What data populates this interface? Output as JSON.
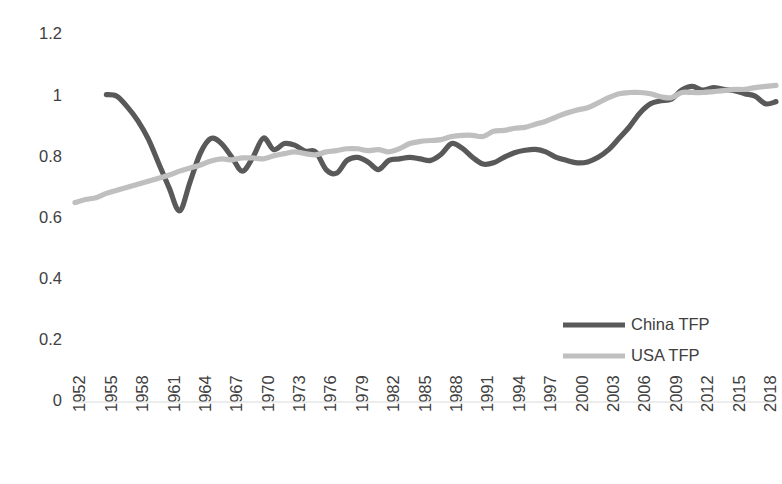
{
  "chart_data": {
    "type": "line",
    "title": "",
    "subtitle": "",
    "xlabel": "",
    "ylabel": "",
    "xlim": [
      1952,
      2019
    ],
    "ylim": [
      0,
      1.2
    ],
    "grid": false,
    "legend_position": "inside-right",
    "y_ticks": [
      "0",
      "0.2",
      "0.4",
      "0.6",
      "0.8",
      "1",
      "1.2"
    ],
    "y_tick_values": [
      0,
      0.2,
      0.4,
      0.6,
      0.8,
      1,
      1.2
    ],
    "x_ticks": [
      "1952",
      "1955",
      "1958",
      "1961",
      "1964",
      "1967",
      "1970",
      "1973",
      "1976",
      "1979",
      "1982",
      "1985",
      "1988",
      "1991",
      "1994",
      "1997",
      "2000",
      "2003",
      "2006",
      "2009",
      "2012",
      "2015",
      "2018"
    ],
    "x_tick_values": [
      1952,
      1955,
      1958,
      1961,
      1964,
      1967,
      1970,
      1973,
      1976,
      1979,
      1982,
      1985,
      1988,
      1991,
      1994,
      1997,
      2000,
      2003,
      2006,
      2009,
      2012,
      2015,
      2018
    ],
    "x_all_years": [
      1952,
      1953,
      1954,
      1955,
      1956,
      1957,
      1958,
      1959,
      1960,
      1961,
      1962,
      1963,
      1964,
      1965,
      1966,
      1967,
      1968,
      1969,
      1970,
      1971,
      1972,
      1973,
      1974,
      1975,
      1976,
      1977,
      1978,
      1979,
      1980,
      1981,
      1982,
      1983,
      1984,
      1985,
      1986,
      1987,
      1988,
      1989,
      1990,
      1991,
      1992,
      1993,
      1994,
      1995,
      1996,
      1997,
      1998,
      1999,
      2000,
      2001,
      2002,
      2003,
      2004,
      2005,
      2006,
      2007,
      2008,
      2009,
      2010,
      2011,
      2012,
      2013,
      2014,
      2015,
      2016,
      2017,
      2018,
      2019
    ],
    "series": [
      {
        "name": "China TFP",
        "color": "#595959",
        "stroke_width": 5.2,
        "start_year": 1955,
        "x": [
          1955,
          1956,
          1957,
          1958,
          1959,
          1960,
          1961,
          1962,
          1963,
          1964,
          1965,
          1966,
          1967,
          1968,
          1969,
          1970,
          1971,
          1972,
          1973,
          1974,
          1975,
          1976,
          1977,
          1978,
          1979,
          1980,
          1981,
          1982,
          1983,
          1984,
          1985,
          1986,
          1987,
          1988,
          1989,
          1990,
          1991,
          1992,
          1993,
          1994,
          1995,
          1996,
          1997,
          1998,
          1999,
          2000,
          2001,
          2002,
          2003,
          2004,
          2005,
          2006,
          2007,
          2008,
          2009,
          2010,
          2011,
          2012,
          2013,
          2014,
          2015,
          2016,
          2017,
          2018,
          2019
        ],
        "values": [
          1.005,
          1.0,
          0.965,
          0.92,
          0.86,
          0.78,
          0.7,
          0.625,
          0.72,
          0.815,
          0.862,
          0.845,
          0.8,
          0.755,
          0.8,
          0.863,
          0.825,
          0.845,
          0.84,
          0.82,
          0.818,
          0.76,
          0.748,
          0.79,
          0.8,
          0.785,
          0.76,
          0.79,
          0.795,
          0.8,
          0.795,
          0.79,
          0.81,
          0.845,
          0.83,
          0.8,
          0.778,
          0.782,
          0.8,
          0.815,
          0.823,
          0.826,
          0.818,
          0.8,
          0.79,
          0.782,
          0.785,
          0.8,
          0.825,
          0.862,
          0.9,
          0.945,
          0.975,
          0.985,
          0.99,
          1.02,
          1.032,
          1.02,
          1.028,
          1.022,
          1.018,
          1.008,
          1.0,
          0.975,
          0.982
        ]
      },
      {
        "name": "USA TFP",
        "color": "#bfbfbf",
        "stroke_width": 5.2,
        "start_year": 1952,
        "x": [
          1952,
          1953,
          1954,
          1955,
          1956,
          1957,
          1958,
          1959,
          1960,
          1961,
          1962,
          1963,
          1964,
          1965,
          1966,
          1967,
          1968,
          1969,
          1970,
          1971,
          1972,
          1973,
          1974,
          1975,
          1976,
          1977,
          1978,
          1979,
          1980,
          1981,
          1982,
          1983,
          1984,
          1985,
          1986,
          1987,
          1988,
          1989,
          1990,
          1991,
          1992,
          1993,
          1994,
          1995,
          1996,
          1997,
          1998,
          1999,
          2000,
          2001,
          2002,
          2003,
          2004,
          2005,
          2006,
          2007,
          2008,
          2009,
          2010,
          2011,
          2012,
          2013,
          2014,
          2015,
          2016,
          2017,
          2018,
          2019
        ],
        "values": [
          0.652,
          0.662,
          0.668,
          0.682,
          0.692,
          0.702,
          0.712,
          0.722,
          0.732,
          0.742,
          0.755,
          0.765,
          0.775,
          0.788,
          0.795,
          0.792,
          0.798,
          0.798,
          0.795,
          0.805,
          0.812,
          0.818,
          0.812,
          0.808,
          0.818,
          0.822,
          0.828,
          0.828,
          0.822,
          0.825,
          0.818,
          0.828,
          0.845,
          0.852,
          0.855,
          0.858,
          0.868,
          0.872,
          0.872,
          0.868,
          0.885,
          0.888,
          0.895,
          0.898,
          0.908,
          0.918,
          0.932,
          0.945,
          0.955,
          0.962,
          0.978,
          0.995,
          1.008,
          1.012,
          1.012,
          1.008,
          0.998,
          0.995,
          1.012,
          1.012,
          1.012,
          1.015,
          1.018,
          1.022,
          1.022,
          1.028,
          1.032,
          1.035
        ]
      }
    ],
    "legend": [
      {
        "label": "China TFP",
        "color": "#595959"
      },
      {
        "label": "USA TFP",
        "color": "#bfbfbf"
      }
    ]
  }
}
